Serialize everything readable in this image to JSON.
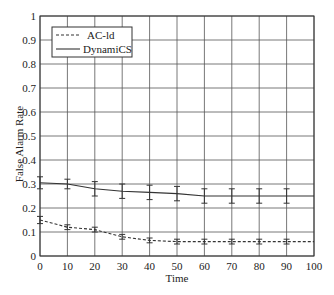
{
  "chart_data": {
    "type": "line",
    "title": "",
    "xlabel": "Time",
    "ylabel": "False Alarm Rate",
    "xlim": [
      0,
      100
    ],
    "ylim": [
      0,
      1
    ],
    "xticks": [
      0,
      10,
      20,
      30,
      40,
      50,
      60,
      70,
      80,
      90,
      100
    ],
    "xtick_labels": [
      "0",
      "10",
      "20",
      "30",
      "40",
      "50",
      "60",
      "70",
      "80",
      "90",
      "100"
    ],
    "yticks": [
      0,
      0.1,
      0.2,
      0.3,
      0.4,
      0.5,
      0.6,
      0.7,
      0.8,
      0.9,
      1
    ],
    "ytick_labels": [
      "0",
      "0.1",
      "0.2",
      "0.3",
      "0.4",
      "0.5",
      "0.6",
      "0.7",
      "0.8",
      "0.9",
      "1"
    ],
    "grid": true,
    "legend_position": "upper left",
    "x": [
      0,
      10,
      20,
      30,
      40,
      50,
      60,
      70,
      80,
      90,
      100
    ],
    "series": [
      {
        "name": "AC-ld",
        "style": "dashed",
        "color": "#333333",
        "values": [
          0.15,
          0.12,
          0.11,
          0.08,
          0.065,
          0.06,
          0.06,
          0.06,
          0.06,
          0.06,
          0.06
        ],
        "error": [
          0.015,
          0.01,
          0.01,
          0.01,
          0.01,
          0.01,
          0.01,
          0.01,
          0.01,
          0.01,
          0.0
        ]
      },
      {
        "name": "DynamiCS",
        "style": "solid",
        "color": "#333333",
        "values": [
          0.305,
          0.3,
          0.28,
          0.27,
          0.265,
          0.26,
          0.25,
          0.25,
          0.25,
          0.25,
          0.25
        ],
        "error": [
          0.025,
          0.02,
          0.03,
          0.03,
          0.03,
          0.03,
          0.03,
          0.03,
          0.03,
          0.03,
          0.0
        ]
      }
    ]
  },
  "colors": {
    "axis": "#333333",
    "grid": "#555555",
    "background": "#ffffff"
  }
}
